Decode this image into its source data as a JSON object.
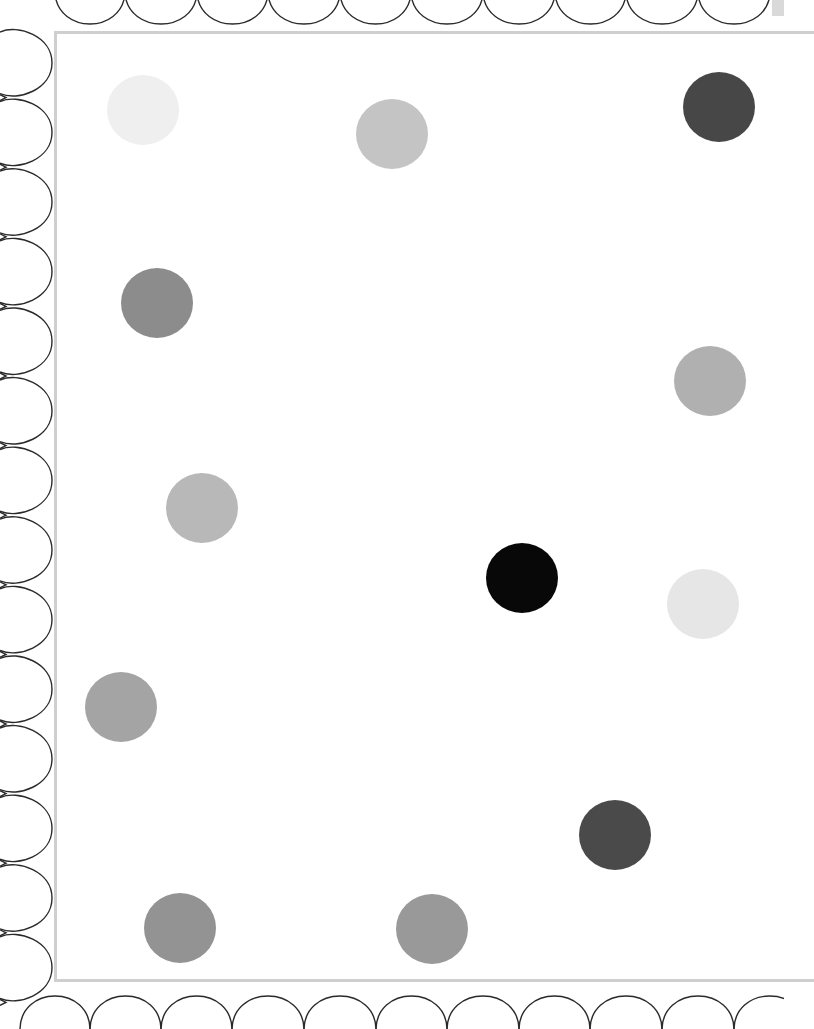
{
  "page": {
    "type": "scalloped-border polka-dot printable",
    "background_color": "#ffffff",
    "frame_color": "#cfcfcf",
    "scallop_stroke_color": "#2a2a2a"
  },
  "watermark": {
    "text": "",
    "legibility": "illegible, very faint diagonal text",
    "color": "#f6f6f6"
  },
  "borders": {
    "top_scallops": {
      "count": 10,
      "junctions_x": [
        55,
        125,
        197,
        268,
        340,
        411,
        483,
        555,
        626,
        698,
        770
      ]
    },
    "left_scallops": {
      "count": 14,
      "start_y": 28,
      "spacing": 69.6
    },
    "bottom_scallops": {
      "count": 11,
      "junctions_x": [
        20,
        90,
        161,
        232,
        304,
        376,
        447,
        519,
        590,
        662,
        734
      ]
    }
  },
  "dots": [
    {
      "id": "dot-1",
      "cx": 143,
      "cy": 110,
      "color": "#efefef"
    },
    {
      "id": "dot-2",
      "cx": 392,
      "cy": 134,
      "color": "#c4c4c4"
    },
    {
      "id": "dot-3",
      "cx": 719,
      "cy": 107,
      "color": "#474747"
    },
    {
      "id": "dot-4",
      "cx": 157,
      "cy": 303,
      "color": "#8c8c8c"
    },
    {
      "id": "dot-5",
      "cx": 710,
      "cy": 381,
      "color": "#b0b0b0"
    },
    {
      "id": "dot-6",
      "cx": 202,
      "cy": 508,
      "color": "#b8b8b8"
    },
    {
      "id": "dot-7",
      "cx": 522,
      "cy": 578,
      "color": "#080808"
    },
    {
      "id": "dot-8",
      "cx": 703,
      "cy": 604,
      "color": "#e6e6e6"
    },
    {
      "id": "dot-9",
      "cx": 121,
      "cy": 707,
      "color": "#a4a4a4"
    },
    {
      "id": "dot-10",
      "cx": 615,
      "cy": 835,
      "color": "#4a4a4a"
    },
    {
      "id": "dot-11",
      "cx": 180,
      "cy": 928,
      "color": "#939393"
    },
    {
      "id": "dot-12",
      "cx": 432,
      "cy": 929,
      "color": "#999999"
    }
  ]
}
